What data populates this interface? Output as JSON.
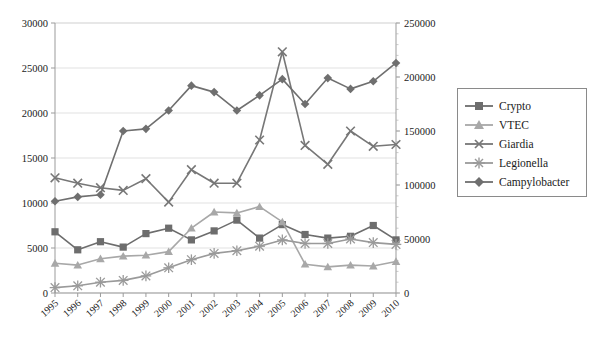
{
  "chart_data": {
    "type": "line",
    "title": "",
    "xlabel": "",
    "ylabel": "",
    "grid": true,
    "legend_position": "right",
    "x": [
      "1995",
      "1996",
      "1997",
      "1998",
      "1999",
      "2000",
      "2001",
      "2002",
      "2003",
      "2004",
      "2005",
      "2006",
      "2007",
      "2008",
      "2009",
      "2010"
    ],
    "axes": {
      "left": {
        "label": "",
        "min": 0,
        "max": 30000,
        "step": 5000,
        "ticks": [
          "0",
          "5000",
          "10000",
          "15000",
          "20000",
          "25000",
          "30000"
        ]
      },
      "right": {
        "label": "",
        "min": 0,
        "max": 250000,
        "step": 50000,
        "ticks": [
          "0",
          "50000",
          "100000",
          "150000",
          "200000",
          "250000"
        ]
      }
    },
    "series": [
      {
        "name": "Crypto",
        "marker": "square",
        "axis": "left",
        "color": "#6d6d6d",
        "values": [
          6800,
          4800,
          5700,
          5100,
          6600,
          7200,
          5900,
          6900,
          8100,
          6100,
          7600,
          6500,
          6100,
          6300,
          7500,
          5900
        ]
      },
      {
        "name": "VTEC",
        "marker": "triangle",
        "axis": "left",
        "color": "#a8a8a8",
        "values": [
          3300,
          3100,
          3800,
          4100,
          4200,
          4600,
          7200,
          9000,
          8900,
          9600,
          7900,
          3200,
          2900,
          3100,
          3000,
          3500
        ]
      },
      {
        "name": "Giardia",
        "marker": "cross",
        "axis": "left",
        "color": "#777777",
        "values": [
          12800,
          12200,
          11700,
          11400,
          12700,
          10100,
          13700,
          12200,
          12200,
          17000,
          26800,
          16400,
          14300,
          18000,
          16300,
          16500
        ]
      },
      {
        "name": "Legionella",
        "marker": "asterisk",
        "axis": "left",
        "color": "#9a9a9a",
        "values": [
          600,
          800,
          1200,
          1400,
          1900,
          2800,
          3700,
          4400,
          4700,
          5200,
          5900,
          5500,
          5500,
          6000,
          5600,
          5400
        ]
      },
      {
        "name": "Campylobacter",
        "marker": "diamond",
        "axis": "right",
        "color": "#6f6f6f",
        "values": [
          85000,
          89000,
          91000,
          150000,
          152000,
          169000,
          192000,
          186000,
          169000,
          183000,
          198000,
          175000,
          199000,
          189000,
          196000,
          213000
        ]
      }
    ]
  },
  "legend": {
    "items": [
      {
        "label": "Crypto"
      },
      {
        "label": "VTEC"
      },
      {
        "label": "Giardia"
      },
      {
        "label": "Legionella"
      },
      {
        "label": "Campylobacter"
      }
    ]
  }
}
